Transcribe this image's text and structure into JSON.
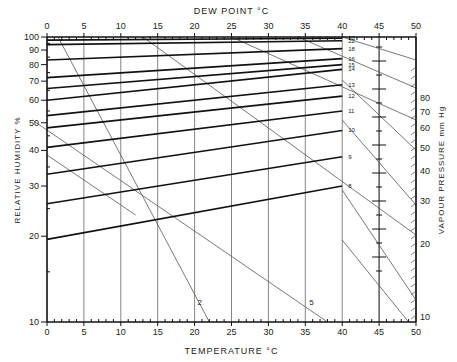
{
  "chart_data": {
    "type": "line",
    "top_axis": {
      "label": "DEW  POINT  °C",
      "ticks": [
        0,
        5,
        10,
        15,
        20,
        25,
        30,
        35,
        40,
        45,
        50
      ]
    },
    "bottom_axis": {
      "label": "TEMPERATURE  °C",
      "ticks": [
        0,
        5,
        10,
        15,
        20,
        25,
        30,
        35,
        40,
        45,
        50
      ],
      "range": [
        0,
        50
      ]
    },
    "left_axis": {
      "label": "RELATIVE HUMIDITY %",
      "scale": "log",
      "ticks": [
        10,
        20,
        30,
        40,
        50,
        60,
        70,
        80,
        90,
        100
      ],
      "range": [
        10,
        100
      ]
    },
    "right_axis": {
      "label": "VAPOUR PRESSURE  mm Hg",
      "scale": "log",
      "ticks": [
        10,
        20,
        30,
        40,
        50,
        60,
        70,
        80
      ]
    },
    "humidity_lines": [
      {
        "label": "30",
        "y_left": 97.5,
        "y_right": 99
      },
      {
        "label": "22",
        "y_left": 94,
        "y_right": 97
      },
      {
        "label": "18",
        "y_left": 83,
        "y_right": 91
      },
      {
        "label": "16",
        "y_left": 72,
        "y_right": 84
      },
      {
        "label": "15",
        "y_left": 66,
        "y_right": 80
      },
      {
        "label": "14",
        "y_left": 60,
        "y_right": 77
      },
      {
        "label": "13",
        "y_left": 53,
        "y_right": 68
      },
      {
        "label": "12",
        "y_left": 48,
        "y_right": 62
      },
      {
        "label": "11",
        "y_left": 41,
        "y_right": 55
      },
      {
        "label": "10",
        "y_left": 33,
        "y_right": 47
      },
      {
        "label": "9",
        "y_left": 26,
        "y_right": 38
      },
      {
        "label": "8",
        "y_left": 19.5,
        "y_right": 30
      }
    ],
    "diagonal_labels": [
      "2",
      "5"
    ],
    "grid": true
  }
}
